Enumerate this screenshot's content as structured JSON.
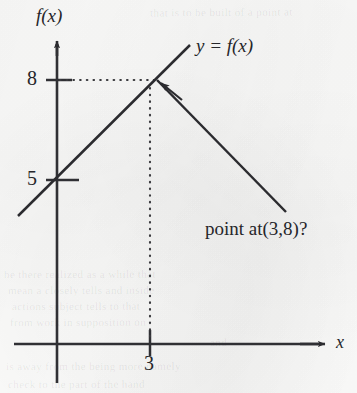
{
  "figure": {
    "kind": "math-function-graph",
    "background_color": "#fcfcfb",
    "ink_color": "#26262a"
  },
  "axes": {
    "y_axis_label": "f(x)",
    "x_axis_label": "x",
    "origin_px": {
      "x": 57,
      "y": 344
    },
    "y_ticks": [
      {
        "label": "8",
        "value": 8,
        "y_px": 80
      },
      {
        "label": "5",
        "value": 5,
        "y_px": 180
      }
    ],
    "x_ticks": [
      {
        "label": "3",
        "value": 3,
        "x_px": 150
      }
    ]
  },
  "curve": {
    "label": "y = f(x)",
    "type": "piecewise-linear",
    "vertex": {
      "x": 3,
      "y": 8
    },
    "y_intercept": 5,
    "segments": [
      {
        "name": "ascending-branch",
        "from_px": {
          "x": 18,
          "y": 216
        },
        "to_px": {
          "x": 190,
          "y": 45
        }
      },
      {
        "name": "descending-branch",
        "from_px": {
          "x": 157,
          "y": 80
        },
        "to_px": {
          "x": 286,
          "y": 212
        }
      }
    ]
  },
  "guides": [
    {
      "name": "horizontal-guide-to-8",
      "style": "dotted",
      "from_px": {
        "x": 59,
        "y": 80
      },
      "to_px": {
        "x": 155,
        "y": 80
      }
    },
    {
      "name": "vertical-guide-to-3",
      "style": "dotted",
      "from_px": {
        "x": 150,
        "y": 86
      },
      "to_px": {
        "x": 150,
        "y": 343
      }
    }
  ],
  "annotation": {
    "text": "point at(3,8)?",
    "pointer_target": {
      "x": 3,
      "y": 8
    }
  },
  "ghost_print": [
    {
      "text": "that is to be built of a point at",
      "left": 150,
      "top": 6,
      "size": 11,
      "rotate": -0.4
    },
    {
      "text": "be there realized as a while that",
      "left": 4,
      "top": 268,
      "size": 11,
      "rotate": -0.2
    },
    {
      "text": "mean a closely tells and inside",
      "left": 8,
      "top": 284,
      "size": 11,
      "rotate": -0.2
    },
    {
      "text": "actions  subject  tells  to  that",
      "left": 12,
      "top": 300,
      "size": 11,
      "rotate": -0.2
    },
    {
      "text": "from  work  in  supposition  on",
      "left": 10,
      "top": 316,
      "size": 11,
      "rotate": -0.2
    },
    {
      "text": "is  away  from  the  being  more  namely",
      "left": 6,
      "top": 360,
      "size": 11,
      "rotate": -0.2
    },
    {
      "text": "check  to  the  part  of  the  hand",
      "left": 8,
      "top": 378,
      "size": 11,
      "rotate": -0.2
    },
    {
      "text": "and",
      "left": 210,
      "top": 336,
      "size": 11,
      "rotate": -0.2
    }
  ]
}
